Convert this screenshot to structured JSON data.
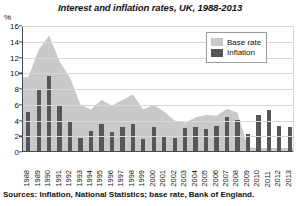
{
  "chart_data": {
    "type": "area",
    "title": "Interest and inflation rates, UK, 1988-2013",
    "unit_label": "%",
    "xlabel": "",
    "ylabel": "",
    "ylim": [
      0,
      16
    ],
    "ytick_step": 2,
    "yticks": [
      0,
      2,
      4,
      6,
      8,
      10,
      12,
      14,
      16
    ],
    "grid": true,
    "legend_position": "top-right",
    "categories": [
      "1988",
      "1989",
      "1990",
      "1991",
      "1992",
      "1993",
      "1994",
      "1995",
      "1996",
      "1997",
      "1998",
      "1999",
      "2000",
      "2001",
      "2002",
      "2003",
      "2004",
      "2005",
      "2006",
      "2007",
      "2008",
      "2009",
      "2010",
      "2011",
      "2012",
      "2013"
    ],
    "series": [
      {
        "name": "Base rate",
        "type": "area",
        "color": "#c9c9c9",
        "values": [
          9.5,
          13.0,
          14.8,
          11.5,
          9.4,
          6.0,
          5.4,
          6.6,
          5.9,
          6.6,
          7.3,
          5.4,
          6.0,
          5.1,
          4.0,
          3.7,
          4.4,
          4.7,
          4.6,
          5.5,
          5.0,
          0.6,
          0.5,
          0.5,
          0.5,
          0.5
        ]
      },
      {
        "name": "Inflation",
        "type": "bar",
        "color": "#56565a",
        "values": [
          4.9,
          7.8,
          9.5,
          5.9,
          3.7,
          1.6,
          2.5,
          3.4,
          2.4,
          3.1,
          3.4,
          1.5,
          3.0,
          1.8,
          1.7,
          2.9,
          3.0,
          2.8,
          3.2,
          4.3,
          4.0,
          2.2,
          4.6,
          5.2,
          3.2,
          3.0
        ]
      }
    ],
    "source_note": "Sources: Inflation, National Statistics; base rate, Bank of England."
  },
  "legend": {
    "items": [
      {
        "label": "Base rate"
      },
      {
        "label": "Inflation"
      }
    ]
  }
}
